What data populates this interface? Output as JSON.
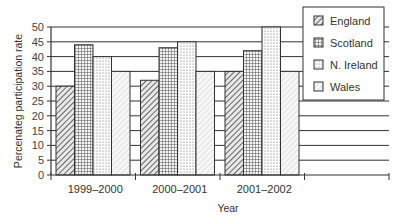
{
  "chart_data": {
    "type": "bar",
    "title": "",
    "xlabel": "Year",
    "ylabel": "Percenateg participation rate",
    "categories": [
      "1999–2000",
      "2000–2001",
      "2001–2002"
    ],
    "series": [
      {
        "name": "England",
        "pattern": "diagonal-hatch",
        "values": [
          30,
          32,
          35
        ]
      },
      {
        "name": "Scotland",
        "pattern": "grid-check",
        "values": [
          44,
          43,
          42
        ]
      },
      {
        "name": "N. Ireland",
        "pattern": "dotted",
        "values": [
          40,
          45,
          50
        ]
      },
      {
        "name": "Wales",
        "pattern": "light-hatch",
        "values": [
          35,
          35,
          35
        ]
      }
    ],
    "ylim": [
      0,
      50
    ],
    "yticks": [
      0,
      5,
      10,
      15,
      20,
      25,
      30,
      35,
      40,
      45,
      50
    ],
    "grid": true,
    "legend_position": "upper-right"
  },
  "labels": {
    "xlabel": "Year",
    "ylabel": "Percenateg participation rate",
    "legend": [
      "England",
      "Scotland",
      "N. Ireland",
      "Wales"
    ]
  }
}
